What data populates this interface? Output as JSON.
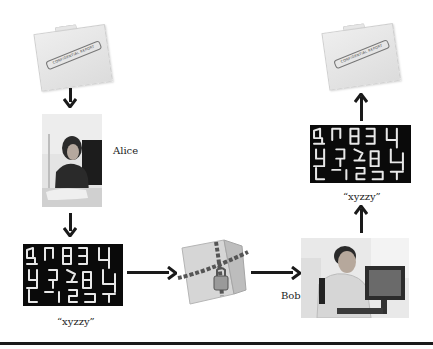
{
  "diagram": {
    "title": "",
    "document_stamp_text": "CONFIDENTIAL REPORT",
    "sender": {
      "name": "Alice",
      "icon": "person-at-computer-photo"
    },
    "receiver": {
      "name": "Bob",
      "icon": "person-at-computer-photo"
    },
    "key_left": {
      "label": "“xyzzy”",
      "icon": "seven-segment-key-display"
    },
    "key_right": {
      "label": "“xyzzy”",
      "icon": "seven-segment-key-display"
    },
    "locked_document_icon": "chained-padlocked-folder",
    "colors": {
      "arrow": "#1a1a1a",
      "display_bg": "#0a0a0a",
      "display_segments": "#e8e8e8",
      "rule": "#1a1a1a"
    },
    "flow": [
      "confidential-report -> Alice",
      "Alice -> key xyzzy (encrypt)",
      "key -> locked folder",
      "locked folder -> Bob",
      "Bob -> key xyzzy (decrypt)",
      "key -> confidential-report"
    ]
  }
}
